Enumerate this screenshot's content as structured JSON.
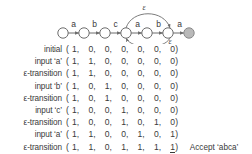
{
  "figure": {
    "name": "nfa-state-diagram",
    "states": [
      {
        "id": 0,
        "label": "",
        "accepting": false
      },
      {
        "id": 1,
        "label": "",
        "accepting": false
      },
      {
        "id": 2,
        "label": "",
        "accepting": false
      },
      {
        "id": 3,
        "label": "",
        "accepting": false
      },
      {
        "id": 4,
        "label": "",
        "accepting": false
      },
      {
        "id": 5,
        "label": "",
        "accepting": false
      },
      {
        "id": 6,
        "label": "",
        "accepting": true
      }
    ],
    "edges": [
      {
        "from": 0,
        "to": 1,
        "label": "a"
      },
      {
        "from": 1,
        "to": 2,
        "label": "b"
      },
      {
        "from": 2,
        "to": 3,
        "label": "c"
      },
      {
        "from": 3,
        "to": 4,
        "label": "a"
      },
      {
        "from": 4,
        "to": 5,
        "label": "b"
      },
      {
        "from": 5,
        "to": 6,
        "label": "a"
      }
    ],
    "epsilon_edges": [
      {
        "from": 3,
        "to": 5,
        "label": "ε",
        "position": "above"
      },
      {
        "from": 5,
        "to": 3,
        "label": "ε",
        "position": "below"
      }
    ],
    "edge_labels": [
      "a",
      "b",
      "c",
      "a",
      "b",
      "a"
    ],
    "epsilon_label_top": "ε",
    "epsilon_label_bottom": "ε",
    "colors": {
      "stroke": "#6d6d6d",
      "state_fill": "#ffffff",
      "accepting_fill": "#b9b9b9",
      "text": "#3a3a3a"
    }
  },
  "trace": {
    "open_paren": "(",
    "close_paren": ")",
    "comma": ",",
    "rows": [
      {
        "label": "initial",
        "values": [
          "1",
          "0",
          "0",
          "0",
          "0",
          "0",
          "0"
        ],
        "underline_last": false,
        "note": ""
      },
      {
        "label": "input ‘a’",
        "values": [
          "1",
          "1",
          "0",
          "0",
          "0",
          "0",
          "0"
        ],
        "underline_last": false,
        "note": ""
      },
      {
        "label": "ε-transition",
        "values": [
          "1",
          "1",
          "0",
          "0",
          "0",
          "0",
          "0"
        ],
        "underline_last": false,
        "note": ""
      },
      {
        "label": "input ‘b’",
        "values": [
          "1",
          "0",
          "1",
          "0",
          "0",
          "0",
          "0"
        ],
        "underline_last": false,
        "note": ""
      },
      {
        "label": "ε-transition",
        "values": [
          "1",
          "0",
          "1",
          "0",
          "0",
          "0",
          "0"
        ],
        "underline_last": false,
        "note": ""
      },
      {
        "label": "input ‘c’",
        "values": [
          "1",
          "0",
          "0",
          "1",
          "0",
          "0",
          "0"
        ],
        "underline_last": false,
        "note": ""
      },
      {
        "label": "ε-transition",
        "values": [
          "1",
          "0",
          "0",
          "1",
          "0",
          "1",
          "0"
        ],
        "underline_last": false,
        "note": ""
      },
      {
        "label": "input ‘a’",
        "values": [
          "1",
          "1",
          "0",
          "0",
          "1",
          "0",
          "1"
        ],
        "underline_last": false,
        "note": ""
      },
      {
        "label": "ε-transition",
        "values": [
          "1",
          "1",
          "0",
          "1",
          "1",
          "1",
          "1"
        ],
        "underline_last": true,
        "note": "Accept ‘abca’"
      }
    ]
  }
}
